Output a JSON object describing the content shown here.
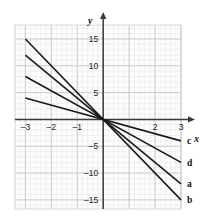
{
  "chart_data": {
    "type": "line",
    "title": "",
    "subtitle": "",
    "xlabel": "x",
    "ylabel": "y",
    "xlim": [
      -3.0,
      3.0
    ],
    "ylim": [
      -16.7,
      17.6
    ],
    "grid": true,
    "grid_major_step_x": 1,
    "grid_major_step_y": 5,
    "grid_minor_step_x": 0.2,
    "grid_minor_step_y": 1,
    "legend_position": "right-of-line-ends",
    "x_tick_values": [
      -3,
      -2,
      -1,
      1,
      2,
      3
    ],
    "x_tick_labels": [
      "-3",
      "-2",
      "-1",
      "",
      "2",
      "3"
    ],
    "y_tick_values": [
      15,
      10,
      5,
      -5,
      -10,
      -15
    ],
    "y_tick_labels": [
      "15",
      "10",
      "5",
      "-5",
      "-10",
      "-15"
    ],
    "series": [
      {
        "name": "c",
        "label": "c",
        "slope": -1.3333,
        "intercept": 0,
        "color": "#1a1a1a",
        "x": [
          -3,
          3
        ],
        "values": [
          4,
          -4
        ]
      },
      {
        "name": "d",
        "label": "d",
        "slope": -2.6667,
        "intercept": 0,
        "color": "#1a1a1a",
        "x": [
          -3,
          3
        ],
        "values": [
          8,
          -8
        ]
      },
      {
        "name": "a",
        "label": "a",
        "slope": -4,
        "intercept": 0,
        "color": "#1a1a1a",
        "x": [
          -3,
          3
        ],
        "values": [
          12,
          -12
        ]
      },
      {
        "name": "b",
        "label": "b",
        "slope": -5,
        "intercept": 0,
        "color": "#1a1a1a",
        "x": [
          -3,
          3
        ],
        "values": [
          15,
          -15
        ]
      }
    ],
    "annotations": []
  },
  "axes": {
    "x_axis_name": "x",
    "y_axis_name": "y"
  },
  "labels": {
    "x_neg3": "-3",
    "x_neg2": "-2",
    "x_neg1": "-1",
    "x_pos2": "2",
    "x_pos3": "3",
    "y_15": "15",
    "y_10": "10",
    "y_5": "5",
    "y_neg5": "-5",
    "y_neg10": "-10",
    "y_neg15": "-15",
    "line_c": "c",
    "line_d": "d",
    "line_a": "a",
    "line_b": "b"
  },
  "colors": {
    "line": "#1a1a1a",
    "axis": "#3a3a3a",
    "grid_major": "#c9c9c9",
    "grid_minor": "#e8e8e8",
    "plot_bg": "#fdfdfd",
    "text": "#1a1a1a"
  }
}
